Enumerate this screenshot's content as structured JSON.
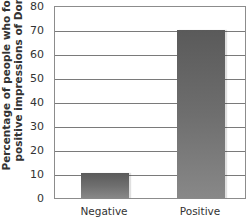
{
  "chart_data": {
    "type": "bar",
    "title": "",
    "xlabel": "",
    "ylabel": "Percentage of people who formed positive impressions of Donald",
    "ylabel_lines": [
      "Percentage of people who formed",
      "positive impressions of Donald"
    ],
    "categories": [
      "Negative",
      "Positive"
    ],
    "values": [
      10.5,
      70
    ],
    "ylim": [
      0,
      80
    ],
    "yticks": [
      "0",
      "10",
      "20",
      "30",
      "40",
      "50",
      "60",
      "70",
      "80"
    ],
    "grid": true,
    "legend": null,
    "bar_color": "#6a6a6a",
    "caption_partial": "(cut-off caption text below x-axis)"
  }
}
